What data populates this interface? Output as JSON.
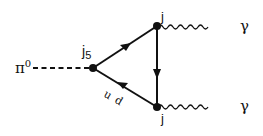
{
  "diagram": {
    "type": "feynman-diagram",
    "incoming": {
      "label": "π",
      "superscript": "0",
      "line_style": "dashed"
    },
    "vertices": [
      {
        "id": "left",
        "label": "j",
        "subscript": "5"
      },
      {
        "id": "top",
        "label": "j"
      },
      {
        "id": "bottom",
        "label": "j"
      }
    ],
    "fermion_loop_labels": {
      "first": "u",
      "second": "d"
    },
    "outgoing": [
      {
        "label": "γ",
        "line_style": "wavy"
      },
      {
        "label": "γ",
        "line_style": "wavy"
      }
    ],
    "colors": {
      "line": "#111111",
      "background": "#ffffff"
    }
  }
}
